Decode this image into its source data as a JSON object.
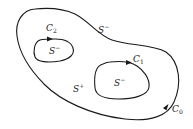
{
  "diagram": {
    "type": "multiply-connected-region",
    "stroke_color": "#1a1a1a",
    "background_color": "#ffffff",
    "contours": [
      {
        "id": "C0",
        "base": "C",
        "sub": "0",
        "role": "outer boundary",
        "orientation": "counterclockwise"
      },
      {
        "id": "C1",
        "base": "C",
        "sub": "1",
        "role": "inner boundary (right)",
        "orientation": "clockwise"
      },
      {
        "id": "C2",
        "base": "C",
        "sub": "2",
        "role": "inner boundary (left)",
        "orientation": "clockwise"
      }
    ],
    "regions": [
      {
        "id": "outer",
        "base": "S",
        "sup": "−",
        "location": "outside C0"
      },
      {
        "id": "middle",
        "base": "S",
        "sup": "+",
        "location": "between C0 and inner contours"
      },
      {
        "id": "inner_left",
        "base": "S",
        "sup": "−",
        "location": "inside C2"
      },
      {
        "id": "inner_right",
        "base": "S",
        "sup": "−",
        "location": "inside C1"
      }
    ]
  },
  "labels": {
    "c0": {
      "base": "C",
      "sub": "0"
    },
    "c1": {
      "base": "C",
      "sub": "1"
    },
    "c2": {
      "base": "C",
      "sub": "2"
    },
    "s_outer": {
      "base": "S",
      "sup": "−"
    },
    "s_middle": {
      "base": "S",
      "sup": "+"
    },
    "s_inner_left": {
      "base": "S",
      "sup": "−"
    },
    "s_inner_right": {
      "base": "S",
      "sup": "−"
    }
  }
}
